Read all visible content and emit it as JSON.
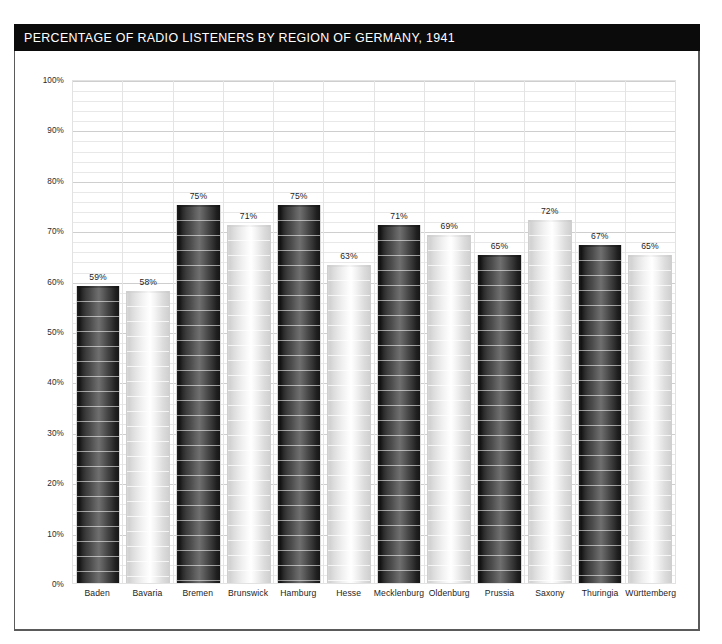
{
  "header": {
    "title": "PERCENTAGE OF RADIO LISTENERS BY REGION OF GERMANY, 1941",
    "background_color": "#0b0b0b",
    "text_color": "#ffffff"
  },
  "chart_data": {
    "type": "bar",
    "title": "PERCENTAGE OF RADIO LISTENERS BY REGION OF GERMANY, 1941",
    "xlabel": "",
    "ylabel": "",
    "ylim": [
      0,
      100
    ],
    "grid": true,
    "legend": "none",
    "categories": [
      "Baden",
      "Bavaria",
      "Bremen",
      "Brunswick",
      "Hamburg",
      "Hesse",
      "Mecklenburg",
      "Oldenburg",
      "Prussia",
      "Saxony",
      "Thuringia",
      "Württemberg"
    ],
    "values": [
      59,
      58,
      75,
      71,
      75,
      63,
      71,
      69,
      65,
      72,
      67,
      65
    ],
    "value_labels": [
      "59%",
      "58%",
      "75%",
      "71%",
      "75%",
      "63%",
      "71%",
      "69%",
      "65%",
      "72%",
      "67%",
      "65%"
    ],
    "bar_styles": [
      "dark",
      "light",
      "dark",
      "light",
      "dark",
      "light",
      "dark",
      "light",
      "dark",
      "light",
      "dark",
      "light"
    ],
    "ytick_labels": [
      "100%",
      "90%",
      "80%",
      "70%",
      "60%",
      "50%",
      "40%",
      "30%",
      "20%",
      "10%",
      "0%"
    ],
    "ytick_values": [
      100,
      90,
      80,
      70,
      60,
      50,
      40,
      30,
      20,
      10,
      0
    ],
    "colors": {
      "bar_dark": "#3d3d3d",
      "bar_light": "#e8e8e8",
      "gridline": "#e4e4e4",
      "axis_text": "#1d1d1d",
      "plot_background": "#ffffff",
      "frame_border": "#5a5a5a"
    }
  }
}
